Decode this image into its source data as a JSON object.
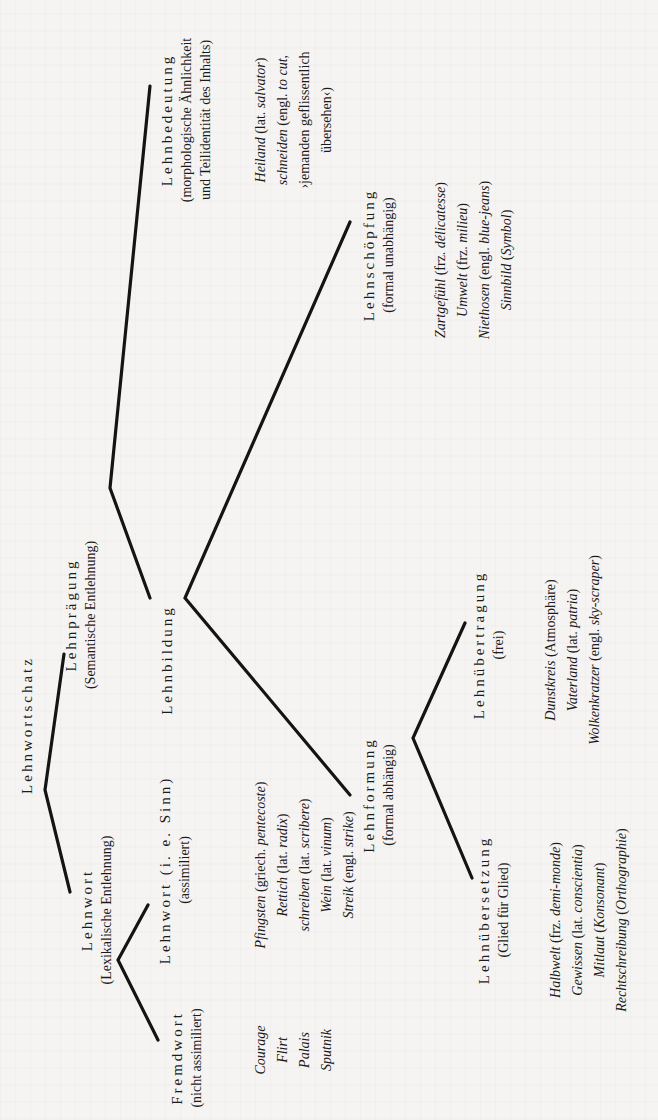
{
  "diagram": {
    "orientation": "rotated-90-ccw",
    "root": {
      "title": "Lehnwortschatz"
    },
    "lehnwort": {
      "title": "Lehnwort",
      "sub": "(Lexikalische Entlehnung)"
    },
    "fremdwort": {
      "title": "Fremdwort",
      "sub": "(nicht assimiliert)",
      "examples": [
        "Courage",
        "Flirt",
        "Palais",
        "Sputnik"
      ]
    },
    "lehnwort_sinn": {
      "title": "Lehnwort (i. e. Sinn)",
      "sub": "(assimiliert)",
      "examples": [
        {
          "word": "Pfingsten",
          "gloss_pre": " (griech. ",
          "gloss_it": "pentecoste",
          "gloss_post": ")"
        },
        {
          "word": "Rettich",
          "gloss_pre": " (lat. ",
          "gloss_it": "radix",
          "gloss_post": ")"
        },
        {
          "word": "schreiben",
          "gloss_pre": " (lat. ",
          "gloss_it": "scribere",
          "gloss_post": ")"
        },
        {
          "word": "Wein",
          "gloss_pre": " (lat. ",
          "gloss_it": "vinum",
          "gloss_post": ")"
        },
        {
          "word": "Streik",
          "gloss_pre": " (engl. ",
          "gloss_it": "strike",
          "gloss_post": ")"
        }
      ]
    },
    "lehnpraegung": {
      "title": "Lehnprägung",
      "sub": "(Semantische Entlehnung)"
    },
    "lehnbedeutung": {
      "title": "Lehnbedeutung",
      "sub1": "(morphologische Ähnlichkeit",
      "sub2": "und Teilidentität des Inhalts)",
      "examples": [
        {
          "word": "Heiland",
          "gloss_pre": " (lat. ",
          "gloss_it": "salvator",
          "gloss_post": ")"
        },
        {
          "word": "schneiden",
          "gloss_pre": " (engl. ",
          "gloss_it": "to cut,",
          "gloss_post": ""
        },
        {
          "word": "",
          "gloss_pre": "›jemanden geflissentlich",
          "gloss_it": "",
          "gloss_post": ""
        },
        {
          "word": "",
          "gloss_pre": "übersehen‹)",
          "gloss_it": "",
          "gloss_post": ""
        }
      ]
    },
    "lehnbildung": {
      "title": "Lehnbildung"
    },
    "lehnschoepfung": {
      "title": "Lehnschöpfung",
      "sub": "(formal unabhängig)",
      "examples": [
        {
          "word": "Zartgefühl",
          "gloss_pre": " (frz. ",
          "gloss_it": "délicatesse",
          "gloss_post": ")"
        },
        {
          "word": "Umwelt",
          "gloss_pre": " (frz. ",
          "gloss_it": "milieu",
          "gloss_post": ")"
        },
        {
          "word": "Niethosen",
          "gloss_pre": " (engl. ",
          "gloss_it": "blue-jeans",
          "gloss_post": ")"
        },
        {
          "word": "Sinnbild",
          "gloss_pre": " (",
          "gloss_it": "Symbol",
          "gloss_post": ")"
        }
      ]
    },
    "lehnformung": {
      "title": "Lehnformung",
      "sub": "(formal abhängig)"
    },
    "lehnuebertragung": {
      "title": "Lehnübertragung",
      "sub": "(frei)",
      "examples": [
        {
          "word": "Dunstkreis",
          "gloss_pre": " (Atmosphäre)",
          "gloss_it": "",
          "gloss_post": ""
        },
        {
          "word": "Vaterland",
          "gloss_pre": " (lat. ",
          "gloss_it": "patria",
          "gloss_post": ")"
        },
        {
          "word": "Wolkenkratzer",
          "gloss_pre": " (engl. ",
          "gloss_it": "sky-scraper",
          "gloss_post": ")"
        }
      ]
    },
    "lehnuebersetzung": {
      "title": "Lehnübersetzung",
      "sub": "(Glied für Glied)",
      "examples": [
        {
          "word": "Halbwelt",
          "gloss_pre": " (frz. ",
          "gloss_it": "demi-monde",
          "gloss_post": ")"
        },
        {
          "word": "Gewissen",
          "gloss_pre": " (lat. ",
          "gloss_it": "conscientia",
          "gloss_post": ")"
        },
        {
          "word": "Mitlaut",
          "gloss_pre": " (",
          "gloss_it": "Konsonant",
          "gloss_post": ")"
        },
        {
          "word": "Rechtschreibung",
          "gloss_pre": " (",
          "gloss_it": "Orthographie",
          "gloss_post": ")"
        }
      ]
    }
  },
  "colors": {
    "paper": "#f5f4f2",
    "ink": "#141414"
  }
}
